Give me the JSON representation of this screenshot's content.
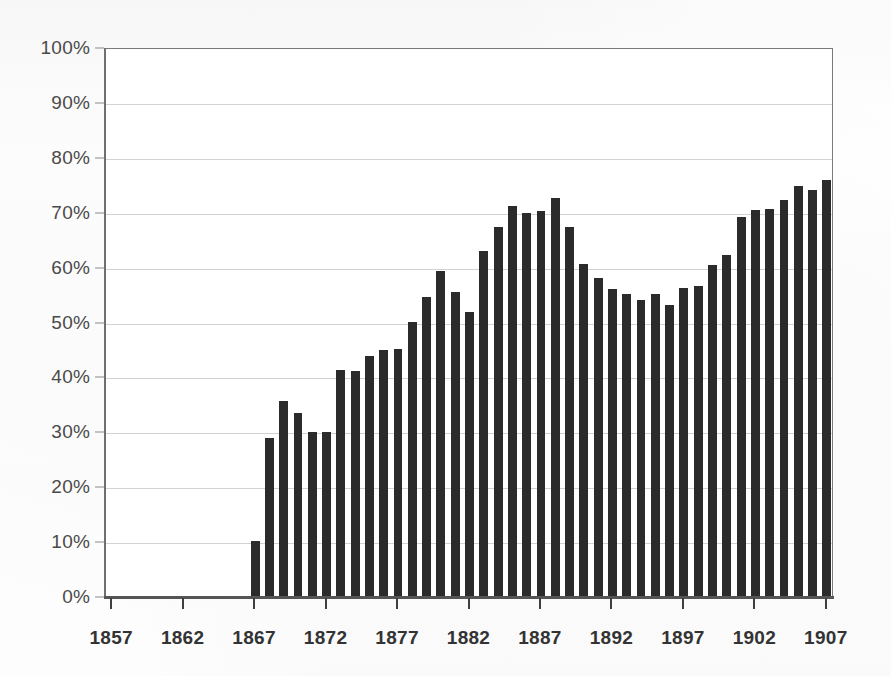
{
  "chart_data": {
    "type": "bar",
    "title": "",
    "subtitle": "",
    "xlabel": "",
    "ylabel": "",
    "xlim": [
      1857,
      1907
    ],
    "ylim": [
      0,
      100
    ],
    "grid": true,
    "legend": null,
    "bar_color": "#2b2b2b",
    "axis_color": "#7b7b7b",
    "gridline_color": "#d2d2d2",
    "y_ticks": [
      0,
      10,
      20,
      30,
      40,
      50,
      60,
      70,
      80,
      90,
      100
    ],
    "y_tick_labels": [
      "0%",
      "10%",
      "20%",
      "30%",
      "40%",
      "50%",
      "60%",
      "70%",
      "80%",
      "90%",
      "100%"
    ],
    "x_ticks": [
      1857,
      1862,
      1867,
      1872,
      1877,
      1882,
      1887,
      1892,
      1897,
      1902,
      1907
    ],
    "x_tick_labels": [
      "1857",
      "1862",
      "1867",
      "1872",
      "1877",
      "1882",
      "1887",
      "1892",
      "1897",
      "1902",
      "1907"
    ],
    "categories": [
      1857,
      1858,
      1859,
      1860,
      1861,
      1862,
      1863,
      1864,
      1865,
      1866,
      1867,
      1868,
      1869,
      1870,
      1871,
      1872,
      1873,
      1874,
      1875,
      1876,
      1877,
      1878,
      1879,
      1880,
      1881,
      1882,
      1883,
      1884,
      1885,
      1886,
      1887,
      1888,
      1889,
      1890,
      1891,
      1892,
      1893,
      1894,
      1895,
      1896,
      1897,
      1898,
      1899,
      1900,
      1901,
      1902,
      1903,
      1904,
      1905,
      1906,
      1907
    ],
    "values": [
      0,
      0,
      0,
      0,
      0,
      0,
      0,
      0,
      0,
      0,
      10.0,
      28.8,
      35.6,
      33.3,
      29.8,
      29.8,
      41.2,
      41.0,
      43.8,
      44.8,
      45.0,
      49.9,
      54.4,
      59.2,
      55.3,
      51.7,
      62.8,
      67.2,
      71.1,
      69.7,
      70.1,
      72.5,
      67.3,
      60.4,
      57.9,
      55.9,
      55.1,
      53.9,
      55.0,
      53.0,
      56.1,
      56.5,
      60.3,
      62.1,
      69.1,
      70.4,
      70.5,
      72.2,
      74.7,
      73.9,
      75.7
    ],
    "value_unit": "%",
    "first_nonzero_year": 1867,
    "peak": {
      "year": 1888,
      "value": 72.5
    },
    "last": {
      "year": 1907,
      "value": 75.7
    }
  }
}
